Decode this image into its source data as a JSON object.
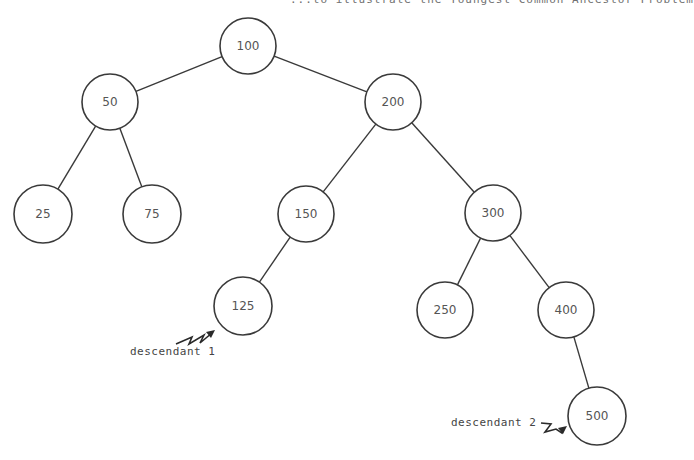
{
  "caption": "...to illustrate the Youngest Common Ancestor Problem",
  "tree": {
    "nodes": [
      {
        "id": "n100",
        "value": "100",
        "cx": 248,
        "cy": 46,
        "r": 28
      },
      {
        "id": "n50",
        "value": "50",
        "cx": 110,
        "cy": 102,
        "r": 28
      },
      {
        "id": "n200",
        "value": "200",
        "cx": 393,
        "cy": 102,
        "r": 28
      },
      {
        "id": "n25",
        "value": "25",
        "cx": 43,
        "cy": 214,
        "r": 29
      },
      {
        "id": "n75",
        "value": "75",
        "cx": 152,
        "cy": 214,
        "r": 29
      },
      {
        "id": "n150",
        "value": "150",
        "cx": 306,
        "cy": 214,
        "r": 28
      },
      {
        "id": "n300",
        "value": "300",
        "cx": 493,
        "cy": 213,
        "r": 28
      },
      {
        "id": "n125",
        "value": "125",
        "cx": 243,
        "cy": 306,
        "r": 29
      },
      {
        "id": "n250",
        "value": "250",
        "cx": 445,
        "cy": 310,
        "r": 28
      },
      {
        "id": "n400",
        "value": "400",
        "cx": 566,
        "cy": 310,
        "r": 28
      },
      {
        "id": "n500",
        "value": "500",
        "cx": 597,
        "cy": 416,
        "r": 29
      }
    ],
    "edges": [
      [
        "n100",
        "n50"
      ],
      [
        "n100",
        "n200"
      ],
      [
        "n50",
        "n25"
      ],
      [
        "n50",
        "n75"
      ],
      [
        "n200",
        "n150"
      ],
      [
        "n200",
        "n300"
      ],
      [
        "n150",
        "n125"
      ],
      [
        "n300",
        "n250"
      ],
      [
        "n300",
        "n400"
      ],
      [
        "n400",
        "n500"
      ]
    ]
  },
  "annotations": {
    "descendant1": {
      "label": "descendant 1",
      "target": "125"
    },
    "descendant2": {
      "label": "descendant 2",
      "target": "500"
    }
  }
}
